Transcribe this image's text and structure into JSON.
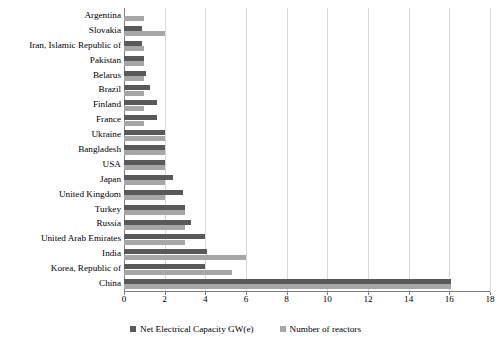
{
  "chart_data": {
    "type": "bar",
    "orientation": "horizontal",
    "title": "",
    "xlabel": "",
    "ylabel": "",
    "xlim": [
      0,
      18
    ],
    "xticks": [
      0,
      2,
      4,
      6,
      8,
      10,
      12,
      14,
      16,
      18
    ],
    "grid": true,
    "legend_position": "bottom",
    "colors": {
      "capacity": "#595959",
      "reactors": "#a6a6a6",
      "gridline": "#d9d9d9",
      "axis": "#808080"
    },
    "categories": [
      "Argentina",
      "Slovakia",
      "Iran, Islamic Republic of",
      "Pakistan",
      "Belarus",
      "Brazil",
      "Finland",
      "France",
      "Ukraine",
      "Bangladesh",
      "USA",
      "Japan",
      "United Kingdom",
      "Turkey",
      "Russia",
      "United Arab Emirates",
      "India",
      "Korea, Republic of",
      "China"
    ],
    "series": [
      {
        "name": "Net Electrical Capacity GW(e)",
        "key": "capacity",
        "color": "#595959",
        "values": [
          0.0,
          0.9,
          0.9,
          1.0,
          1.1,
          1.3,
          1.6,
          1.6,
          2.0,
          2.0,
          2.0,
          2.4,
          2.9,
          3.0,
          3.3,
          4.0,
          4.1,
          4.0,
          16.1
        ]
      },
      {
        "name": "Number of reactors",
        "key": "reactors",
        "color": "#a6a6a6",
        "values": [
          1.0,
          2.0,
          1.0,
          1.0,
          1.0,
          1.0,
          1.0,
          1.0,
          2.0,
          2.0,
          2.0,
          2.0,
          2.0,
          3.0,
          3.0,
          3.0,
          6.0,
          5.3,
          16.1
        ]
      }
    ]
  },
  "legend": {
    "items": [
      {
        "label": "Net Electrical Capacity GW(e)",
        "color": "#595959"
      },
      {
        "label": "Number of reactors",
        "color": "#a6a6a6"
      }
    ]
  }
}
